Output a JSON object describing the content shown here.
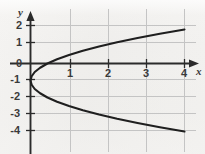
{
  "figure": {
    "background_color": "#efeeec",
    "grid_color": "#c9c9c9",
    "axis_color": "#2b2b2b",
    "curve_color": "#1f1f1f",
    "width": 205,
    "height": 154
  },
  "axes": {
    "x_axis_name": "x",
    "y_axis_name": "y",
    "x_ticks": [
      "1",
      "2",
      "3",
      "4"
    ],
    "y_ticks": [
      "2",
      "1",
      "0",
      "-1",
      "-2",
      "-3",
      "-4"
    ]
  },
  "chart_data": {
    "type": "line",
    "title": "",
    "xlabel": "x",
    "ylabel": "y",
    "xlim": [
      -0.45,
      4.55
    ],
    "ylim": [
      -4.4,
      2.4
    ],
    "grid": true,
    "legend": null,
    "x_ticks": [
      1,
      2,
      3,
      4
    ],
    "y_ticks": [
      2,
      1,
      0,
      -1,
      -2,
      -3,
      -4
    ],
    "equation": "x = (4/9)(y + 1)^2",
    "orientation": "rightward-opening parabola",
    "vertex": [
      0,
      -1
    ],
    "series": [
      {
        "name": "x = (4/9)(y+1)^2",
        "parametric_by": "y",
        "y": [
          2.0,
          1.75,
          1.5,
          1.25,
          1.0,
          0.75,
          0.5,
          0.25,
          0.0,
          -0.25,
          -0.5,
          -0.75,
          -1.0,
          -1.25,
          -1.5,
          -1.75,
          -2.0,
          -2.25,
          -2.5,
          -2.75,
          -3.0,
          -3.25,
          -3.5,
          -3.75,
          -4.0
        ],
        "x": [
          4.0,
          3.36,
          2.78,
          2.25,
          1.78,
          1.36,
          1.0,
          0.69,
          0.44,
          0.25,
          0.11,
          0.03,
          0.0,
          0.03,
          0.11,
          0.25,
          0.44,
          0.69,
          1.0,
          1.36,
          1.78,
          2.25,
          2.78,
          3.36,
          4.0
        ]
      }
    ],
    "annotations": []
  }
}
